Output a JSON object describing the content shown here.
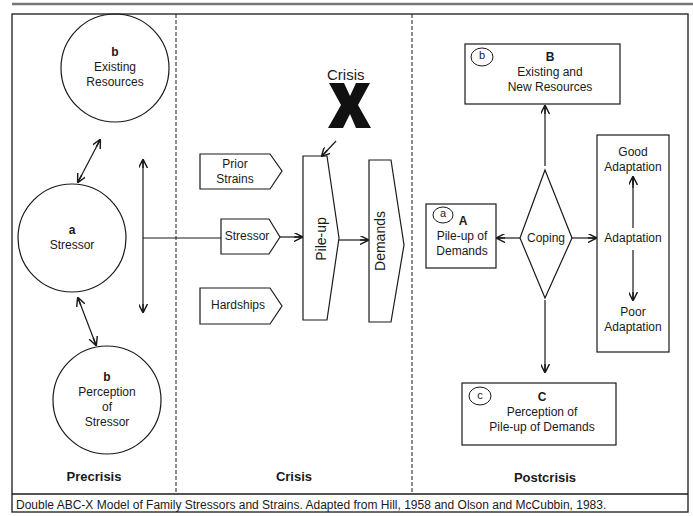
{
  "phases": {
    "precrisis": "Precrisis",
    "crisis": "Crisis",
    "postcrisis": "Postcrisis"
  },
  "precrisis": {
    "existing_resources": {
      "letter": "b",
      "line1": "Existing",
      "line2": "Resources"
    },
    "stressor": {
      "letter": "a",
      "line1": "Stressor"
    },
    "perception": {
      "letter": "b",
      "line1": "Perception",
      "line2": "of",
      "line3": "Stressor"
    }
  },
  "crisis": {
    "crisis_label": "Crisis",
    "crisis_symbol": "X",
    "inputs": [
      {
        "line1": "Prior",
        "line2": "Strains"
      },
      {
        "line1": "Stressor"
      },
      {
        "line1": "Hardships"
      }
    ],
    "pileup": "Pile-up",
    "demands": "Demands"
  },
  "postcrisis": {
    "resources_box": {
      "badge": "b",
      "letter": "B",
      "line1": "Existing and",
      "line2": "New Resources"
    },
    "pileup_box": {
      "badge": "a",
      "letter": "A",
      "line1": "Pile-up of",
      "line2": "Demands"
    },
    "coping": "Coping",
    "adaptation": {
      "good_line1": "Good",
      "good_line2": "Adaptation",
      "middle": "Adaptation",
      "poor_line1": "Poor",
      "poor_line2": "Adaptation"
    },
    "perception_box": {
      "badge": "c",
      "letter": "C",
      "line1": "Perception of",
      "line2": "Pile-up of Demands"
    }
  },
  "caption": "Double ABC-X Model of Family Stressors and Strains.  Adapted from Hill, 1958 and Olson and McCubbin, 1983.",
  "colors": {
    "line": "#1a1a1a",
    "top_rule": "#777777",
    "background": "#ffffff"
  }
}
